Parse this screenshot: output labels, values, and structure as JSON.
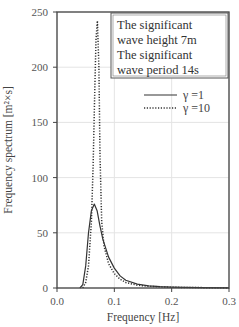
{
  "chart_data": {
    "type": "line",
    "title": "",
    "xlabel": "Frequency [Hz]",
    "ylabel": "Frequency spectrum [m²×s]",
    "xlim": [
      0.0,
      0.3
    ],
    "ylim": [
      0,
      250
    ],
    "xticks": [
      "0.0",
      "0.1",
      "0.2",
      "0.3"
    ],
    "yticks": [
      "0",
      "50",
      "100",
      "150",
      "200",
      "250"
    ],
    "grid": true,
    "legend_position": "upper right (below annotation box)",
    "annotation": [
      "The significant",
      "wave height  7m",
      "The significant",
      "wave period  14s"
    ],
    "series": [
      {
        "name": "γ =1",
        "style": "solid",
        "x": [
          0.04,
          0.045,
          0.05,
          0.055,
          0.06,
          0.065,
          0.07,
          0.075,
          0.08,
          0.09,
          0.1,
          0.11,
          0.12,
          0.14,
          0.16,
          0.18,
          0.2,
          0.25,
          0.3
        ],
        "values": [
          0,
          3,
          20,
          50,
          70,
          76,
          70,
          56,
          44,
          28,
          18,
          11,
          7,
          3.5,
          2,
          1.2,
          0.8,
          0.3,
          0.1
        ]
      },
      {
        "name": "γ =10",
        "style": "dotted",
        "x": [
          0.045,
          0.05,
          0.055,
          0.06,
          0.063,
          0.066,
          0.068,
          0.0705,
          0.073,
          0.075,
          0.078,
          0.082,
          0.09,
          0.1,
          0.11,
          0.12,
          0.14,
          0.16,
          0.2,
          0.3
        ],
        "values": [
          0,
          5,
          20,
          60,
          110,
          180,
          225,
          242,
          200,
          120,
          60,
          38,
          22,
          13,
          8,
          5,
          2.5,
          1.5,
          0.6,
          0.1
        ]
      }
    ]
  },
  "axes": {
    "xlabel": "Frequency [Hz]",
    "ylabel": "Frequency spectrum [m²×s]"
  },
  "annotation": {
    "line1": "The significant",
    "line2": "wave height  7m",
    "line3": "The significant",
    "line4": "wave period  14s"
  },
  "legend": {
    "item1": "γ =1",
    "item2": "γ =10"
  },
  "colors": {
    "line": "#333333",
    "grid": "#e4e4e4",
    "axis": "#444444"
  }
}
